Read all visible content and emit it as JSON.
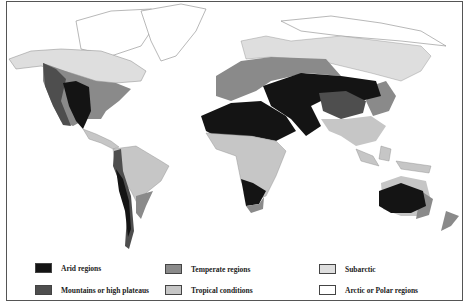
{
  "map": {
    "title": "World climate regions",
    "colors": {
      "arid": "#141414",
      "mountains": "#4e4e4e",
      "temperate": "#8a8a8a",
      "tropical": "#c6c6c6",
      "subarctic": "#dedede",
      "arctic": "#ffffff",
      "outline": "#777777"
    }
  },
  "legend": {
    "items": [
      {
        "key": "arid",
        "label": "Arid regions",
        "color": "#141414"
      },
      {
        "key": "mountains",
        "label": "Mountains or high plateaus",
        "color": "#4e4e4e"
      },
      {
        "key": "temperate",
        "label": "Temperate regions",
        "color": "#8a8a8a"
      },
      {
        "key": "tropical",
        "label": "Tropical conditions",
        "color": "#c6c6c6"
      },
      {
        "key": "subarctic",
        "label": "Subarctic",
        "color": "#dedede"
      },
      {
        "key": "arctic",
        "label": "Arctic or Polar regions",
        "color": "#ffffff"
      }
    ]
  }
}
